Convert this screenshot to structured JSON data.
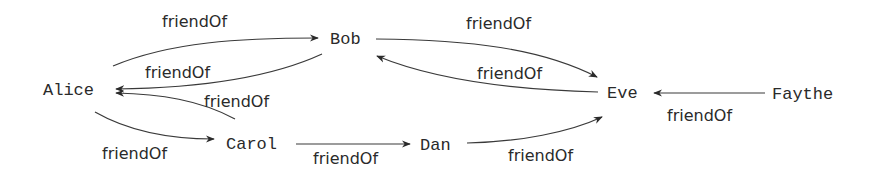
{
  "diagram": {
    "type": "directed-graph",
    "nodes": [
      {
        "id": "alice",
        "label": "Alice"
      },
      {
        "id": "bob",
        "label": "Bob"
      },
      {
        "id": "carol",
        "label": "Carol"
      },
      {
        "id": "dan",
        "label": "Dan"
      },
      {
        "id": "eve",
        "label": "Eve"
      },
      {
        "id": "faythe",
        "label": "Faythe"
      }
    ],
    "edges": [
      {
        "from": "alice",
        "to": "bob",
        "label": "friendOf"
      },
      {
        "from": "bob",
        "to": "alice",
        "label": "friendOf"
      },
      {
        "from": "carol",
        "to": "alice",
        "label": "friendOf"
      },
      {
        "from": "alice",
        "to": "carol",
        "label": "friendOf"
      },
      {
        "from": "bob",
        "to": "eve",
        "label": "friendOf"
      },
      {
        "from": "eve",
        "to": "bob",
        "label": "friendOf"
      },
      {
        "from": "carol",
        "to": "dan",
        "label": "friendOf"
      },
      {
        "from": "dan",
        "to": "eve",
        "label": "friendOf"
      },
      {
        "from": "faythe",
        "to": "eve",
        "label": "friendOf"
      }
    ]
  }
}
